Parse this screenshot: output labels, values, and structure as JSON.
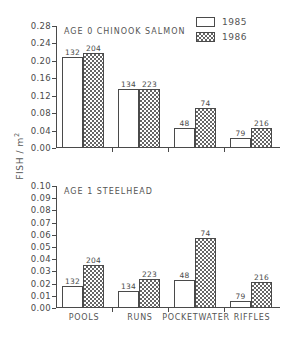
{
  "figure": {
    "ylabel": "FISH / m",
    "ylabel_exponent": "2"
  },
  "legend": {
    "position": "top-right",
    "entries": [
      {
        "label": "1985",
        "key": "1985"
      },
      {
        "label": "1986",
        "key": "1986"
      }
    ]
  },
  "chart_data": [
    {
      "type": "bar",
      "title": "AGE 0 CHINOOK SALMON",
      "xlabel": "",
      "ylabel": "FISH / m2",
      "ylim": [
        0.0,
        0.28
      ],
      "yticks": [
        "0.00",
        "0.04",
        "0.08",
        "0.12",
        "0.16",
        "0.20",
        "0.24",
        "0.28"
      ],
      "ytick_values": [
        0.0,
        0.04,
        0.08,
        0.12,
        0.16,
        0.2,
        0.24,
        0.28
      ],
      "grid": false,
      "categories": [
        "POOLS",
        "RUNS",
        "POCKETWATER",
        "RIFFLES"
      ],
      "series": [
        {
          "name": "1985",
          "values": [
            0.209,
            0.136,
            0.045,
            0.023
          ],
          "point_labels": [
            "132",
            "134",
            "48",
            "79"
          ]
        },
        {
          "name": "1986",
          "values": [
            0.218,
            0.136,
            0.092,
            0.047
          ],
          "point_labels": [
            "204",
            "223",
            "74",
            "216"
          ]
        }
      ]
    },
    {
      "type": "bar",
      "title": "AGE 1 STEELHEAD",
      "xlabel": "",
      "ylabel": "FISH / m2",
      "ylim": [
        0.0,
        0.1
      ],
      "yticks": [
        "0.00",
        "0.01",
        "0.02",
        "0.03",
        "0.04",
        "0.05",
        "0.06",
        "0.07",
        "0.08",
        "0.09",
        "0.10"
      ],
      "ytick_values": [
        0.0,
        0.01,
        0.02,
        0.03,
        0.04,
        0.05,
        0.06,
        0.07,
        0.08,
        0.09,
        0.1
      ],
      "grid": false,
      "categories": [
        "POOLS",
        "RUNS",
        "POCKETWATER",
        "RIFFLES"
      ],
      "series": [
        {
          "name": "1985",
          "values": [
            0.018,
            0.014,
            0.023,
            0.006
          ],
          "point_labels": [
            "132",
            "134",
            "48",
            "79"
          ]
        },
        {
          "name": "1986",
          "values": [
            0.035,
            0.024,
            0.057,
            0.021
          ],
          "point_labels": [
            "204",
            "223",
            "74",
            "216"
          ]
        }
      ]
    }
  ],
  "colors": {
    "axis": "#4a4a4a",
    "text": "#555555",
    "bar_1985_fill": "#ffffff",
    "bar_1986_fill": "#666666"
  }
}
